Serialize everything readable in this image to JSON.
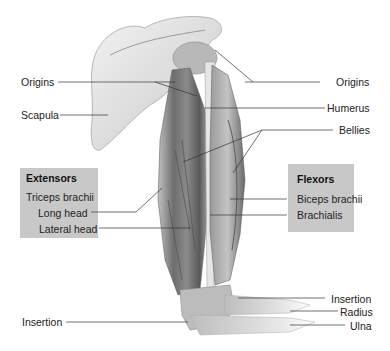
{
  "diagram": {
    "labels_left": {
      "origins": "Origins",
      "scapula": "Scapula",
      "insertion": "Insertion"
    },
    "labels_right": {
      "origins": "Origins",
      "humerus": "Humerus",
      "bellies": "Bellies",
      "insertion": "Insertion",
      "radius": "Radius",
      "ulna": "Ulna"
    },
    "extensors_box": {
      "title": "Extensors",
      "muscle": "Triceps brachii",
      "parts": [
        "Long head",
        "Lateral head"
      ]
    },
    "flexors_box": {
      "title": "Flexors",
      "muscles": [
        "Biceps brachii",
        "Brachialis"
      ]
    },
    "colors": {
      "box_fill": "#c8c8c8",
      "leader_line": "#333333",
      "bone": "#e4e4e4",
      "muscle_dark": "#6a6a6a"
    }
  }
}
